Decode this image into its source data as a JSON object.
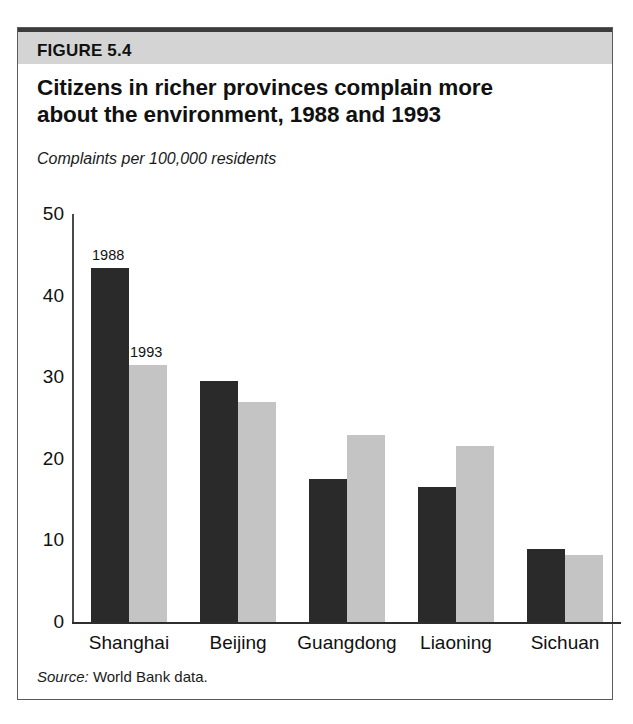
{
  "figure": {
    "number_label": "FIGURE 5.4",
    "title_line_1": "Citizens in richer provinces complain more",
    "title_line_2": "about the environment, 1988 and 1993",
    "subtitle": "Complaints per 100,000 residents",
    "source_prefix": "Source:",
    "source_text": "World Bank data."
  },
  "colors": {
    "banner_background": "#d4d4d4",
    "banner_rule": "#3c3c3c",
    "frame_border": "#5a5a5a",
    "series_1988": "#2a2a2a",
    "series_1993": "#c4c4c4",
    "axis": "#2e2e2e",
    "text": "#111111"
  },
  "chart_data": {
    "type": "bar",
    "title": "Citizens in richer provinces complain more about the environment, 1988 and 1993",
    "subtitle": "Complaints per 100,000 residents",
    "xlabel": "",
    "ylabel": "Complaints per 100,000 residents",
    "ylim": [
      0,
      50
    ],
    "yticks": [
      0,
      10,
      20,
      30,
      40,
      50
    ],
    "ytick_labels": [
      "0",
      "10",
      "20",
      "30",
      "40",
      "50"
    ],
    "grid": false,
    "legend_position": "inline-above-first-bars",
    "categories": [
      "Shanghai",
      "Beijing",
      "Guangdong",
      "Liaoning",
      "Sichuan"
    ],
    "series": [
      {
        "name": "1988",
        "color": "#2a2a2a",
        "values": [
          43.4,
          29.5,
          17.5,
          16.5,
          8.9
        ]
      },
      {
        "name": "1993",
        "color": "#c4c4c4",
        "values": [
          31.5,
          27.0,
          22.9,
          21.6,
          8.2
        ]
      }
    ],
    "annotations": [
      {
        "text": "1988",
        "category": "Shanghai",
        "series": "1988"
      },
      {
        "text": "1993",
        "category": "Shanghai",
        "series": "1993"
      }
    ]
  },
  "geometry": {
    "baseline_y": 621,
    "top_value_y": 213,
    "px_per_unit": 8.17,
    "axis_x": 71,
    "bar_width": 38,
    "group_starts": [
      90,
      199,
      308,
      417,
      526
    ]
  }
}
